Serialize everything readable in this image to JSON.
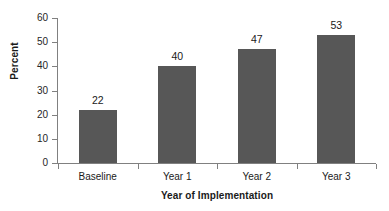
{
  "chart_data": {
    "type": "bar",
    "title": "",
    "categories": [
      "Baseline",
      "Year 1",
      "Year 2",
      "Year 3"
    ],
    "values": [
      22,
      40,
      47,
      53
    ],
    "value_labels": [
      "22",
      "40",
      "47",
      "53"
    ],
    "xlabel": "Year of Implementation",
    "ylabel": "Percent",
    "ylim": [
      0,
      60
    ],
    "yticks": [
      0,
      10,
      20,
      30,
      40,
      50,
      60
    ],
    "ytick_labels": [
      "0",
      "10",
      "20",
      "30",
      "40",
      "50",
      "60"
    ],
    "grid": false,
    "legend": false,
    "legend_position": "none",
    "bar_color": "#575757",
    "axis_color": "#808080",
    "text_color": "#1a1a1a",
    "background": "#ffffff"
  }
}
